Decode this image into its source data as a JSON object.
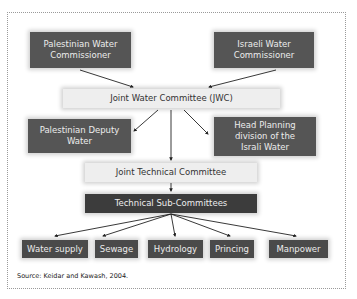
{
  "diagram": {
    "nodes": {
      "pal_commissioner": "Palestinian Water Commissioner",
      "isr_commissioner": "Israeli Water Commissioner",
      "jwc": "Joint Water Committee (JWC)",
      "pal_deputy": "Palestinian Deputy Water",
      "isr_head_planning": "Head Planning division of the Israli Water",
      "jtc": "Joint Technical Committee",
      "subcommittees": "Technical Sub-Committees",
      "leaves": [
        "Water supply",
        "Sewage",
        "Hydrology",
        "Princing",
        "Manpower"
      ]
    },
    "edges": [
      [
        "Palestinian Water Commissioner",
        "Joint Water Committee (JWC)"
      ],
      [
        "Israeli Water Commissioner",
        "Joint Water Committee (JWC)"
      ],
      [
        "Joint Water Committee (JWC)",
        "Palestinian Deputy Water"
      ],
      [
        "Joint Water Committee (JWC)",
        "Head Planning division of the Israli Water"
      ],
      [
        "Joint Water Committee (JWC)",
        "Joint Technical Committee"
      ],
      [
        "Joint Technical Committee",
        "Technical Sub-Committees"
      ],
      [
        "Technical Sub-Committees",
        "Water supply"
      ],
      [
        "Technical Sub-Committees",
        "Sewage"
      ],
      [
        "Technical Sub-Committees",
        "Hydrology"
      ],
      [
        "Technical Sub-Committees",
        "Princing"
      ],
      [
        "Technical Sub-Committees",
        "Manpower"
      ]
    ],
    "source": "Source: Keidar and Kawash, 2004."
  },
  "colors": {
    "dark_box": "#555555",
    "darker_box": "#3c3c3c",
    "light_box": "#eeeeee",
    "arrow": "#222222"
  }
}
